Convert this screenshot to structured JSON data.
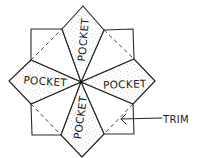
{
  "diagram": {
    "type": "folding-pattern",
    "labels": {
      "pocket_top": "POCKET",
      "pocket_left": "POCKET",
      "pocket_right": "POCKET",
      "pocket_bottom": "POCKET",
      "trim": "TRIM"
    },
    "colors": {
      "line": "#222222",
      "stipple": "#8a8a8a",
      "background": "#ffffff"
    },
    "nodes": [
      {
        "id": "center",
        "x": 81,
        "y": 82
      },
      {
        "id": "pocket-top",
        "label_ref": "pocket_top",
        "shaded": true
      },
      {
        "id": "pocket-left",
        "label_ref": "pocket_left",
        "shaded": true
      },
      {
        "id": "pocket-right",
        "label_ref": "pocket_right",
        "shaded": true
      },
      {
        "id": "pocket-bottom",
        "label_ref": "pocket_bottom",
        "shaded": true
      },
      {
        "id": "corner-top-left",
        "shaded": false,
        "has_dashed_diagonal": true
      },
      {
        "id": "corner-top-right",
        "shaded": false,
        "has_dashed_diagonal": true
      },
      {
        "id": "corner-bottom-left",
        "shaded": false,
        "has_dashed_diagonal": true
      },
      {
        "id": "corner-bottom-right",
        "shaded": false,
        "has_dashed_diagonal": true
      }
    ],
    "annotations": [
      {
        "label_ref": "trim",
        "points_to": "corner-bottom-right dashed line",
        "style": "arrow"
      }
    ]
  }
}
